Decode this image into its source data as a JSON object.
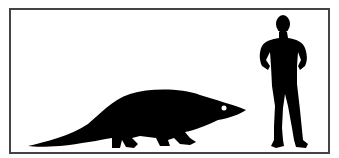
{
  "diagram": {
    "type": "size-comparison",
    "subjects": [
      {
        "name": "animal-silhouette",
        "description": "quadruped reptile-like animal with long tail",
        "color": "#000000"
      },
      {
        "name": "human-silhouette",
        "description": "standing human with hands on hips",
        "color": "#000000"
      }
    ],
    "border_color": "#444444",
    "background": "#ffffff"
  }
}
